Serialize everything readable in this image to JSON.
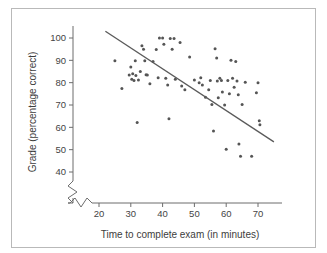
{
  "figure": {
    "background_color": "#ffffff",
    "frame_color": "#b9b9b9",
    "point_color": "#555555",
    "line_color": "#5a5a5a",
    "axis_color": "#6d6d6d"
  },
  "chart_data": {
    "type": "scatter",
    "title": "",
    "xlabel": "Time to complete exam (in minutes)",
    "ylabel": "Grade (percentage correct)",
    "xlim": [
      15,
      76
    ],
    "ylim": [
      38,
      104
    ],
    "xticks": [
      20,
      30,
      40,
      50,
      60,
      70
    ],
    "yticks": [
      40,
      50,
      60,
      70,
      80,
      90,
      100
    ],
    "xtick_labels": [
      "20",
      "30",
      "40",
      "50",
      "60",
      "70"
    ],
    "ytick_labels": [
      "40",
      "50",
      "60",
      "70",
      "80",
      "90",
      "100"
    ],
    "grid": false,
    "legend": null,
    "axis_break_x": true,
    "axis_break_y": true,
    "points": [
      [
        25.0,
        89.8
      ],
      [
        27.2,
        77.4
      ],
      [
        29.5,
        83.4
      ],
      [
        30.0,
        87.0
      ],
      [
        30.3,
        81.5
      ],
      [
        30.6,
        84.0
      ],
      [
        31.0,
        81.0
      ],
      [
        31.4,
        89.8
      ],
      [
        31.6,
        83.2
      ],
      [
        32.0,
        62.2
      ],
      [
        32.4,
        81.2
      ],
      [
        33.0,
        85.0
      ],
      [
        33.5,
        96.5
      ],
      [
        34.0,
        95.0
      ],
      [
        34.4,
        89.8
      ],
      [
        34.8,
        83.5
      ],
      [
        35.2,
        83.4
      ],
      [
        36.0,
        79.5
      ],
      [
        37.0,
        89.5
      ],
      [
        38.0,
        94.8
      ],
      [
        38.6,
        82.2
      ],
      [
        39.0,
        100.0
      ],
      [
        40.0,
        100.0
      ],
      [
        40.4,
        97.2
      ],
      [
        41.0,
        82.0
      ],
      [
        41.6,
        79.0
      ],
      [
        42.0,
        63.8
      ],
      [
        42.4,
        99.8
      ],
      [
        43.0,
        95.0
      ],
      [
        43.6,
        99.8
      ],
      [
        44.0,
        81.5
      ],
      [
        45.5,
        98.0
      ],
      [
        46.0,
        78.5
      ],
      [
        47.0,
        76.8
      ],
      [
        48.5,
        91.5
      ],
      [
        50.0,
        81.2
      ],
      [
        51.5,
        80.0
      ],
      [
        52.0,
        82.2
      ],
      [
        52.5,
        79.0
      ],
      [
        53.5,
        73.5
      ],
      [
        54.5,
        76.8
      ],
      [
        55.0,
        81.0
      ],
      [
        55.5,
        70.2
      ],
      [
        56.0,
        58.4
      ],
      [
        56.5,
        95.2
      ],
      [
        57.0,
        91.0
      ],
      [
        57.2,
        80.8
      ],
      [
        57.5,
        73.2
      ],
      [
        58.0,
        82.0
      ],
      [
        58.5,
        81.0
      ],
      [
        58.8,
        75.8
      ],
      [
        59.5,
        70.0
      ],
      [
        60.0,
        50.2
      ],
      [
        60.5,
        81.0
      ],
      [
        61.0,
        75.0
      ],
      [
        61.5,
        90.0
      ],
      [
        62.0,
        82.0
      ],
      [
        62.5,
        78.0
      ],
      [
        63.0,
        89.5
      ],
      [
        63.4,
        80.8
      ],
      [
        63.8,
        74.6
      ],
      [
        64.0,
        52.5
      ],
      [
        64.5,
        47.0
      ],
      [
        65.0,
        70.2
      ],
      [
        66.0,
        80.2
      ],
      [
        68.0,
        47.0
      ],
      [
        69.5,
        75.5
      ],
      [
        70.0,
        80.0
      ],
      [
        70.4,
        63.0
      ],
      [
        70.6,
        61.2
      ]
    ],
    "regression_line": {
      "x_start": 22.0,
      "y_start": 103.0,
      "x_end": 75.0,
      "y_end": 53.5,
      "description": "negative linear trend line"
    }
  }
}
